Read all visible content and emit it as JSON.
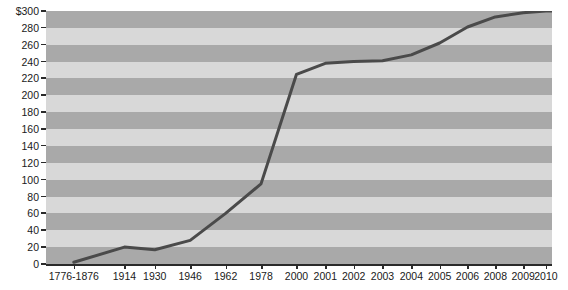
{
  "chart_data": {
    "type": "line",
    "title": "",
    "xlabel": "",
    "ylabel": "",
    "categories": [
      "1776-1876",
      "1914",
      "1930",
      "1946",
      "1962",
      "1978",
      "2000",
      "2001",
      "2002",
      "2003",
      "2004",
      "2005",
      "2006",
      "2008",
      "2009",
      "2010"
    ],
    "values": [
      2,
      20,
      17,
      28,
      60,
      95,
      225,
      238,
      240,
      241,
      248,
      262,
      281,
      293,
      298,
      300
    ],
    "series": [
      {
        "name": "Total",
        "values": [
          2,
          20,
          17,
          28,
          60,
          95,
          225,
          238,
          240,
          241,
          248,
          262,
          281,
          293,
          298,
          300
        ]
      }
    ],
    "ylim": [
      0,
      300
    ],
    "ytick_values": [
      0,
      20,
      40,
      60,
      80,
      100,
      120,
      140,
      160,
      180,
      200,
      220,
      240,
      260,
      280,
      300
    ],
    "ytick_labels": [
      "0",
      "20",
      "40",
      "60",
      "80",
      "100",
      "120",
      "140",
      "160",
      "180",
      "200",
      "220",
      "240",
      "260",
      "280",
      "$300"
    ],
    "xtick_positions": [
      0.055,
      0.155,
      0.215,
      0.285,
      0.355,
      0.425,
      0.495,
      0.552,
      0.608,
      0.665,
      0.722,
      0.778,
      0.833,
      0.888,
      0.943,
      0.988
    ],
    "grid": "horizontal-bands",
    "legend": "none",
    "band_color_dark": "#a9a9a9",
    "band_color_light": "#d8d8d8",
    "line_color": "#4a4a4a",
    "axis_color": "#2a2a2a",
    "background": "#ffffff"
  }
}
